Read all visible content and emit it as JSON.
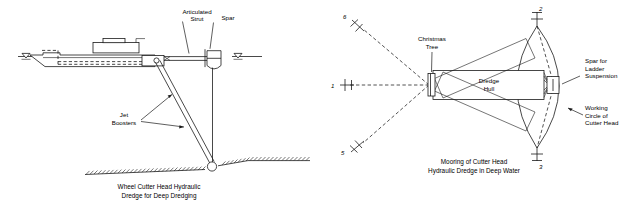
{
  "figure": {
    "background_color": "#ffffff",
    "line_color": "#1a1a1a",
    "panels": [
      {
        "id": "left-panel",
        "name": "wheel-cutter-head-dredge-elevation",
        "caption_line1": "Wheel Cutter Head Hydraulic",
        "caption_line2": "Dredge for Deep Dredging",
        "labels": {
          "articulated_strut_line1": "Articulated",
          "articulated_strut_line2": "Strut",
          "spar": "Spar",
          "jet_boosters_line1": "Jet",
          "jet_boosters_line2": "Boosters"
        },
        "symbols": {
          "waterline_left": "waterline-triangle",
          "waterline_right": "waterline-triangle",
          "seabed": "hatched-seabed"
        }
      },
      {
        "id": "right-panel",
        "name": "mooring-plan-view",
        "caption_line1": "Mooring of Cutter Head",
        "caption_line2": "Hydraulic Dredge in Deep Water",
        "labels": {
          "christmas_tree_line1": "Christmas",
          "christmas_tree_line2": "Tree",
          "dredge_hull_line1": "Dredge",
          "dredge_hull_line2": "Hull",
          "spar_ladder_line1": "Spar for",
          "spar_ladder_line2": "Ladder",
          "spar_ladder_line3": "Suspension",
          "working_circle_line1": "Working",
          "working_circle_line2": "Circle of",
          "working_circle_line3": "Cutter Head"
        },
        "anchors": [
          {
            "id": "anchor-6-upper",
            "number": "6"
          },
          {
            "id": "anchor-1-left",
            "number": "1"
          },
          {
            "id": "anchor-5-lower",
            "number": "5"
          },
          {
            "id": "anchor-2-upper-right",
            "number": "2"
          },
          {
            "id": "anchor-3-lower-right",
            "number": "3"
          }
        ]
      }
    ]
  }
}
